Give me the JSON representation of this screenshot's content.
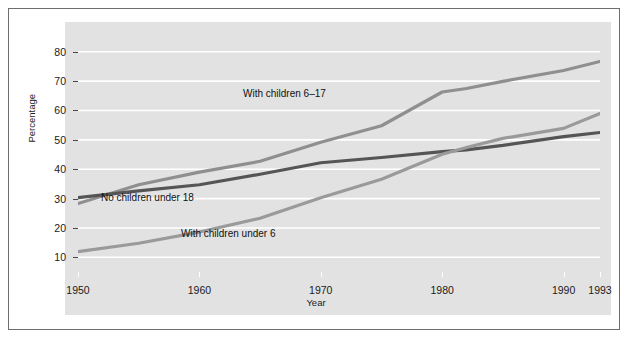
{
  "figure": {
    "background": "#ffffff",
    "panel_color": "#e2e2e2",
    "frame_color": "#6e6e6e",
    "gridline_color": "#ffffff"
  },
  "chart_data": {
    "type": "line",
    "title": "",
    "xlabel": "Year",
    "ylabel": "Percentage",
    "xlim": [
      1950,
      1993
    ],
    "ylim": [
      5,
      84
    ],
    "grid": true,
    "grid_axis": "y",
    "legend": "inline-labels",
    "xticks": [
      1950,
      1960,
      1970,
      1980,
      1990,
      1993
    ],
    "xticklabels": [
      "1950",
      "1960",
      "1970",
      "1980",
      "1990",
      "1993"
    ],
    "yticks": [
      10,
      20,
      30,
      40,
      50,
      60,
      70,
      80
    ],
    "yticklabels": [
      "10",
      "20",
      "30",
      "40",
      "50",
      "60",
      "70",
      "80"
    ],
    "x": [
      1950,
      1955,
      1960,
      1965,
      1970,
      1975,
      1980,
      1982,
      1985,
      1990,
      1993
    ],
    "series": [
      {
        "name": "With children 6-17",
        "label": "With children 6–17",
        "color": "#8f8f8f",
        "width": 3.2,
        "values": [
          28.3,
          34.7,
          39.0,
          42.7,
          49.2,
          54.8,
          66.3,
          67.5,
          69.9,
          73.6,
          76.7
        ]
      },
      {
        "name": "No children under 18",
        "label": "No children under 18",
        "color": "#555555",
        "width": 3.2,
        "values": [
          30.3,
          32.6,
          34.7,
          38.3,
          42.2,
          44.0,
          46.0,
          46.6,
          48.1,
          51.1,
          52.5
        ]
      },
      {
        "name": "With children under 6",
        "label": "With children under 6",
        "color": "#9a9a9a",
        "width": 3.2,
        "values": [
          11.9,
          14.8,
          18.6,
          23.3,
          30.3,
          36.6,
          45.1,
          47.4,
          50.5,
          53.9,
          59.0
        ]
      }
    ]
  }
}
